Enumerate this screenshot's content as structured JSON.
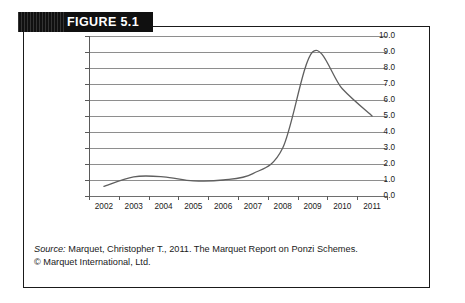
{
  "figure": {
    "banner_label": "FIGURE 5.1"
  },
  "caption": {
    "source_word": "Source:",
    "line1": " Marquet, Christopher T., 2011. The Marquet Report on Ponzi Schemes.",
    "line2": "© Marquet International, Ltd."
  },
  "chart_data": {
    "type": "line",
    "title": "",
    "xlabel": "",
    "ylabel": "",
    "categories": [
      "2002",
      "2003",
      "2004",
      "2005",
      "2006",
      "2007",
      "2008",
      "2009",
      "2010",
      "2011"
    ],
    "values": [
      0.6,
      1.2,
      1.2,
      0.95,
      1.0,
      1.4,
      3.0,
      9.0,
      6.7,
      5.0
    ],
    "series": [
      {
        "name": "Ponzi schemes",
        "values": [
          0.6,
          1.2,
          1.2,
          0.95,
          1.0,
          1.4,
          3.0,
          9.0,
          6.7,
          5.0
        ]
      }
    ],
    "ylim": [
      0.0,
      10.0
    ],
    "ytick_labels": [
      "10.0",
      "9.0",
      "8.0",
      "7.0",
      "6.0",
      "5.0",
      "4.0",
      "3.0",
      "2.0",
      "1.0",
      "0.0"
    ],
    "ytick_values": [
      10.0,
      9.0,
      8.0,
      7.0,
      6.0,
      5.0,
      4.0,
      3.0,
      2.0,
      1.0,
      0.0
    ],
    "grid": "horizontal",
    "legend": "none",
    "line_color": "#5f5f5f",
    "smoothed": true
  }
}
